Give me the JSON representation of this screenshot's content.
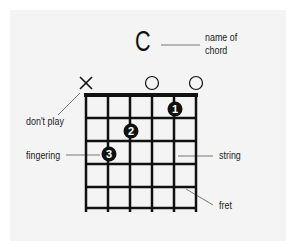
{
  "diagram": {
    "chord_name": "C",
    "labels": {
      "name_of_chord_line1": "name of",
      "name_of_chord_line2": "chord",
      "dont_play": "don't play",
      "fingering": "fingering",
      "string": "string",
      "fret": "fret"
    },
    "string_markers": [
      {
        "string": 1,
        "symbol": "X",
        "meaning": "don't play"
      },
      {
        "string": 4,
        "symbol": "O",
        "meaning": "open"
      },
      {
        "string": 6,
        "symbol": "O",
        "meaning": "open"
      }
    ],
    "fingers": [
      {
        "finger": "1",
        "string": 5,
        "fret": 1
      },
      {
        "finger": "2",
        "string": 3,
        "fret": 2
      },
      {
        "finger": "3",
        "string": 2,
        "fret": 3
      }
    ],
    "strings": 6,
    "frets": 5,
    "colors": {
      "background": "#f4f4f4",
      "ink": "#111111",
      "leader": "#777777"
    }
  }
}
